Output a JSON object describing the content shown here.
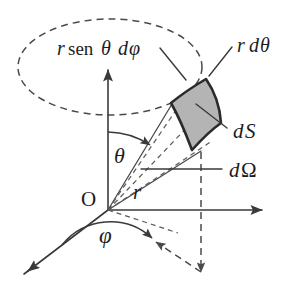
{
  "figure": {
    "labels": {
      "arc_length_phi": "r sen θ dφ",
      "arc_length_theta": "r dθ",
      "area_element": "dS",
      "solid_angle": "dΩ",
      "origin": "O",
      "radius": "r",
      "polar_angle": "θ",
      "azimuth_angle": "φ"
    },
    "label_parts": {
      "r_italic": "r",
      "sen_upright": "sen",
      "theta_italic": "θ",
      "d_italic": "d",
      "phi_italic": "φ",
      "d_upright": "d",
      "omega_upright": "Ω",
      "S_italic": "S"
    },
    "colors": {
      "patch_fill": "#b4b4b4",
      "patch_outline": "#2b2b2b",
      "line": "#3a3a3a",
      "dashed_line": "#4a4a4a",
      "background": "#ffffff",
      "text": "#1d1d1d"
    },
    "geometry": {
      "origin_x": 108,
      "origin_y": 210,
      "z_axis_tip_x": 108,
      "z_axis_tip_y": 68,
      "y_axis_tip_x": 266,
      "y_axis_tip_y": 210,
      "x_axis_tip_x": 24,
      "x_axis_tip_y": 274,
      "ellipse_cx": 110,
      "ellipse_cy": 67,
      "ellipse_rx": 92,
      "ellipse_ry": 48
    }
  }
}
